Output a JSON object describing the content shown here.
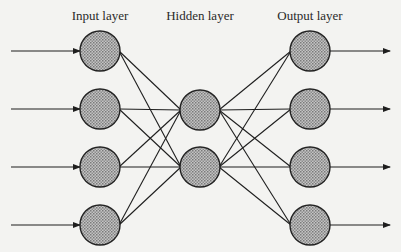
{
  "labels": {
    "input": "Input layer",
    "hidden": "Hidden layer",
    "output": "Output layer"
  },
  "colors": {
    "background": "#f3f3f1",
    "node_fill": "#a9a9a9",
    "line": "#1e1e1e"
  },
  "layers": {
    "input": {
      "x": 100,
      "label_x": 100,
      "nodes": [
        51,
        109,
        167,
        225
      ]
    },
    "hidden": {
      "x": 200,
      "label_x": 200,
      "nodes": [
        110,
        167
      ]
    },
    "output": {
      "x": 310,
      "label_x": 310,
      "nodes": [
        51,
        109,
        167,
        225
      ]
    }
  },
  "node_radius": 20,
  "arrows": {
    "input_start_x": 11,
    "output_end_x": 390
  }
}
